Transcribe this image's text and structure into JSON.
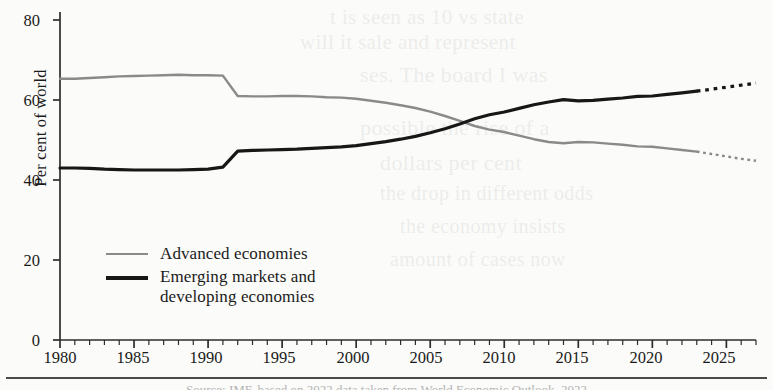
{
  "chart_data": {
    "type": "line",
    "title": "",
    "xlabel": "",
    "ylabel": "Per cent of world",
    "xlim": [
      1980,
      2027
    ],
    "ylim": [
      0,
      80
    ],
    "ytick_labels": [
      "0",
      "20",
      "40",
      "60",
      "80"
    ],
    "yticks": [
      0,
      20,
      40,
      60,
      80
    ],
    "xtick_labels": [
      "1980",
      "1985",
      "1990",
      "1995",
      "2000",
      "2005",
      "2010",
      "2015",
      "2020",
      "2025"
    ],
    "xticks": [
      1980,
      1985,
      1990,
      1995,
      2000,
      2005,
      2010,
      2015,
      2020,
      2025
    ],
    "minor_tick_interval": 1,
    "grid": false,
    "legend_position": "inside-lower-left",
    "forecast_start_year": 2023,
    "forecast_style": "dotted",
    "x": [
      1980,
      1981,
      1982,
      1983,
      1984,
      1985,
      1986,
      1987,
      1988,
      1989,
      1990,
      1991,
      1992,
      1993,
      1994,
      1995,
      1996,
      1997,
      1998,
      1999,
      2000,
      2001,
      2002,
      2003,
      2004,
      2005,
      2006,
      2007,
      2008,
      2009,
      2010,
      2011,
      2012,
      2013,
      2014,
      2015,
      2016,
      2017,
      2018,
      2019,
      2020,
      2021,
      2022,
      2023,
      2024,
      2025,
      2026,
      2027
    ],
    "series": [
      {
        "name": "Advanced economies",
        "color": "#8a8a8a",
        "width": 2.4,
        "values": [
          65.3,
          65.3,
          65.5,
          65.7,
          65.9,
          66.0,
          66.1,
          66.2,
          66.3,
          66.2,
          66.2,
          66.1,
          61.0,
          60.9,
          60.9,
          61.0,
          61.0,
          60.9,
          60.7,
          60.6,
          60.3,
          59.8,
          59.3,
          58.7,
          58.0,
          57.1,
          56.0,
          54.8,
          53.5,
          52.6,
          52.0,
          51.1,
          50.2,
          49.5,
          49.2,
          49.5,
          49.4,
          49.1,
          48.8,
          48.4,
          48.3,
          47.9,
          47.5,
          47.1,
          46.5,
          45.9,
          45.3,
          44.8
        ]
      },
      {
        "name": "Emerging markets and developing economies",
        "color": "#171717",
        "width": 3.2,
        "values": [
          43.0,
          43.0,
          42.9,
          42.7,
          42.6,
          42.5,
          42.5,
          42.5,
          42.5,
          42.6,
          42.7,
          43.2,
          47.2,
          47.4,
          47.5,
          47.6,
          47.7,
          47.9,
          48.1,
          48.3,
          48.6,
          49.1,
          49.6,
          50.2,
          50.9,
          51.8,
          52.8,
          54.0,
          55.3,
          56.3,
          57.0,
          57.9,
          58.8,
          59.5,
          60.1,
          59.8,
          59.9,
          60.2,
          60.5,
          60.9,
          61.0,
          61.4,
          61.8,
          62.2,
          62.7,
          63.2,
          63.7,
          64.2
        ]
      }
    ]
  },
  "ghost_text": [
    {
      "text": "t is seen as 10 vs state",
      "x": 330,
      "y": 5,
      "size": 21
    },
    {
      "text": "will it sale and represent",
      "x": 300,
      "y": 30,
      "size": 21
    },
    {
      "text": "ses. The board I was",
      "x": 360,
      "y": 62,
      "size": 22
    },
    {
      "text": "possible the rise of a",
      "x": 360,
      "y": 115,
      "size": 22
    },
    {
      "text": "dollars per cent",
      "x": 380,
      "y": 150,
      "size": 22
    },
    {
      "text": "the drop in different odds",
      "x": 380,
      "y": 182,
      "size": 20
    },
    {
      "text": "the economy insists",
      "x": 400,
      "y": 215,
      "size": 20
    },
    {
      "text": "amount of cases now",
      "x": 390,
      "y": 248,
      "size": 20
    }
  ],
  "footer": {
    "note": "Source: IMF, based on 2022 data taken from World Economic Outlook, 2022"
  }
}
